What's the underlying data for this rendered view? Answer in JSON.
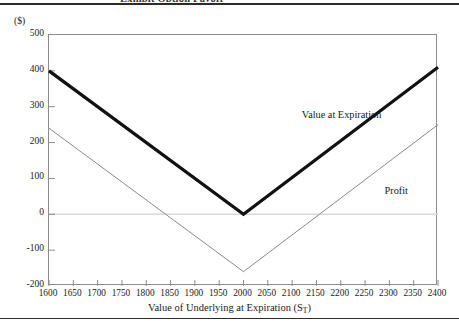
{
  "figure": {
    "caption_fragment": "Exhibit  Option Payoff",
    "y_unit_label": "($)",
    "x_axis_title_text": "Value of Underlying at Expiration (S",
    "x_axis_title_sub": "T",
    "x_axis_title_close": ")"
  },
  "colors": {
    "value_line": "#111111",
    "profit_line": "#8a8a8a",
    "zero_line": "#d9d9d9",
    "frame": "#8c8c8c",
    "rule": "#2b2b2b",
    "text": "#1a1a1a"
  },
  "chart_data": {
    "type": "line",
    "title": "",
    "subtitle": "",
    "xlabel": "Value of Underlying at Expiration (ST)",
    "ylabel": "($)",
    "xlim": [
      1600,
      2400
    ],
    "ylim": [
      -200,
      500
    ],
    "xticks": [
      1600,
      1650,
      1700,
      1750,
      1800,
      1850,
      1900,
      1950,
      2000,
      2050,
      2100,
      2150,
      2200,
      2250,
      2300,
      2350,
      2400
    ],
    "yticks": [
      500,
      400,
      300,
      200,
      100,
      0,
      -100,
      -200
    ],
    "grid": false,
    "zero_line": 0,
    "legend_position": "inline-annotations",
    "series": [
      {
        "name": "Value  at Expiration",
        "style": "thick",
        "width": 3.2,
        "color": "#111111",
        "x": [
          1600,
          2000,
          2400
        ],
        "values": [
          400,
          0,
          410
        ],
        "annotation": {
          "label": "Value  at Expiration",
          "x": 2120,
          "y": 290
        }
      },
      {
        "name": "Profit",
        "style": "thin",
        "width": 1,
        "color": "#8a8a8a",
        "x": [
          1600,
          2000,
          2400
        ],
        "values": [
          240,
          -160,
          250
        ],
        "annotation": {
          "label": "Profit",
          "x": 2290,
          "y": 80
        }
      }
    ]
  }
}
